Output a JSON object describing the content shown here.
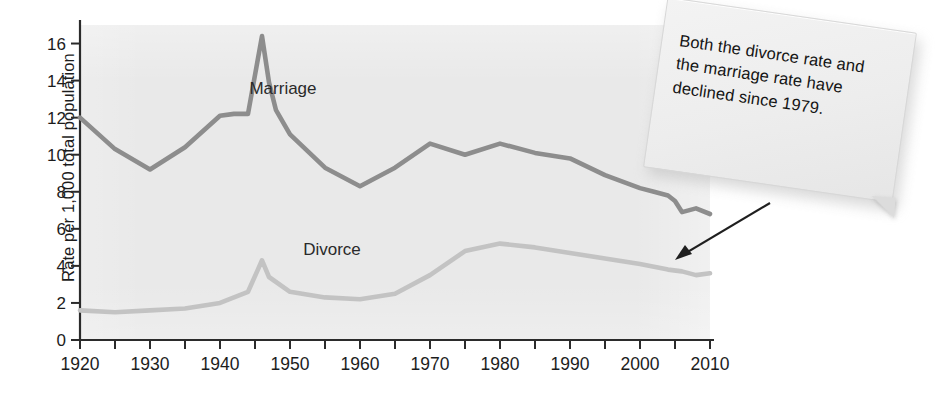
{
  "chart_data": {
    "type": "line",
    "title": "",
    "xlabel": "",
    "ylabel": "Rate per 1,000 total population",
    "xlim": [
      1920,
      2010
    ],
    "ylim": [
      0,
      17
    ],
    "xticks": [
      1920,
      1925,
      1930,
      1935,
      1940,
      1945,
      1950,
      1955,
      1960,
      1965,
      1970,
      1975,
      1980,
      1985,
      1990,
      1995,
      2000,
      2005,
      2010
    ],
    "xtick_labels": [
      "1920",
      "1930",
      "1940",
      "1950",
      "1960",
      "1970",
      "1980",
      "1990",
      "2000",
      "2010"
    ],
    "xtick_label_values": [
      1920,
      1930,
      1940,
      1950,
      1960,
      1970,
      1980,
      1990,
      2000,
      2010
    ],
    "yticks": [
      0,
      2,
      4,
      6,
      8,
      10,
      12,
      14,
      16
    ],
    "ytick_labels": [
      "0",
      "2",
      "4",
      "6",
      "8",
      "10",
      "12",
      "14",
      "16"
    ],
    "grid": false,
    "legend": "inline-labels",
    "series": [
      {
        "name": "Marriage",
        "color": "#8d8d8d",
        "label_x": 1949,
        "label_y": 13.3,
        "x": [
          1920,
          1925,
          1930,
          1935,
          1940,
          1942,
          1944,
          1946,
          1947,
          1948,
          1950,
          1955,
          1960,
          1965,
          1970,
          1975,
          1980,
          1985,
          1990,
          1995,
          2000,
          2002,
          2004,
          2005,
          2006,
          2008,
          2010
        ],
        "y": [
          12.0,
          10.3,
          9.2,
          10.4,
          12.1,
          12.2,
          12.2,
          16.4,
          13.9,
          12.4,
          11.1,
          9.3,
          8.3,
          9.3,
          10.6,
          10.0,
          10.6,
          10.1,
          9.8,
          8.9,
          8.2,
          8.0,
          7.8,
          7.5,
          6.9,
          7.1,
          6.8
        ]
      },
      {
        "name": "Divorce",
        "color": "#c3c3c3",
        "label_x": 1956,
        "label_y": 4.6,
        "x": [
          1920,
          1925,
          1930,
          1935,
          1940,
          1944,
          1946,
          1947,
          1950,
          1955,
          1960,
          1965,
          1970,
          1975,
          1980,
          1985,
          1990,
          1995,
          2000,
          2004,
          2006,
          2008,
          2010
        ],
        "y": [
          1.6,
          1.5,
          1.6,
          1.7,
          2.0,
          2.6,
          4.3,
          3.4,
          2.6,
          2.3,
          2.2,
          2.5,
          3.5,
          4.8,
          5.2,
          5.0,
          4.7,
          4.4,
          4.1,
          3.8,
          3.7,
          3.5,
          3.6
        ]
      }
    ],
    "annotation": {
      "text_lines": [
        "Both the divorce rate and",
        "the marriage rate have",
        "declined since 1979."
      ],
      "points_to_x": 2005,
      "points_to_y": 4.0
    }
  },
  "styling": {
    "plot_background": "#e9e9e9",
    "page_background": "#ffffff",
    "axis_color": "#2b2b2b",
    "text_color": "#1c1c1c",
    "callout_background": "#efefef"
  },
  "ghost_text": [
    "and see arrive at the rest",
    "Formula A",
    "Hospital R",
    "to the legal for the main",
    "Problem D",
    "mass a second to not can be",
    "single R"
  ]
}
